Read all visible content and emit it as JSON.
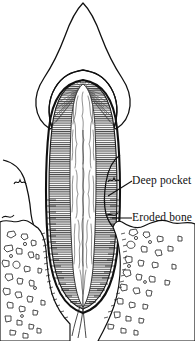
{
  "figure": {
    "width": 195,
    "height": 341,
    "background_color": "#ffffff",
    "ink_color": "#101010",
    "hatch_color": "#3a3a3a"
  },
  "labels": [
    {
      "id": "deep-pocket",
      "text": "Deep pocket",
      "x": 132,
      "y": 175,
      "leader": {
        "type": "line",
        "from_x": 108,
        "from_y": 196,
        "to_x": 132,
        "to_y": 181
      }
    },
    {
      "id": "eroded-bone",
      "text": "Eroded bone",
      "x": 132,
      "y": 212,
      "leader": {
        "type": "line",
        "from_x": 112,
        "from_y": 218,
        "to_x": 132,
        "to_y": 218
      }
    }
  ],
  "anatomy": {
    "parts": [
      {
        "name": "enamel-crown",
        "description": "pointed crown outline with cusp apex"
      },
      {
        "name": "dentin",
        "description": "horizontally hatched body of tooth"
      },
      {
        "name": "dentin-tubules-fan",
        "description": "radiating fan lines under cusp"
      },
      {
        "name": "pulp-canal",
        "description": "central textured canal running root length"
      },
      {
        "name": "gingiva-left",
        "description": "receded gum flap on left"
      },
      {
        "name": "gingiva-right",
        "description": "receded gum flap on right"
      },
      {
        "name": "periodontal-ligament",
        "description": "fiber band around root"
      },
      {
        "name": "alveolar-bone-left",
        "description": "trabecular bone stipple left"
      },
      {
        "name": "alveolar-bone-right",
        "description": "trabecular bone stipple right"
      },
      {
        "name": "root-apex",
        "description": "rounded root tip with apical fibers"
      }
    ]
  }
}
